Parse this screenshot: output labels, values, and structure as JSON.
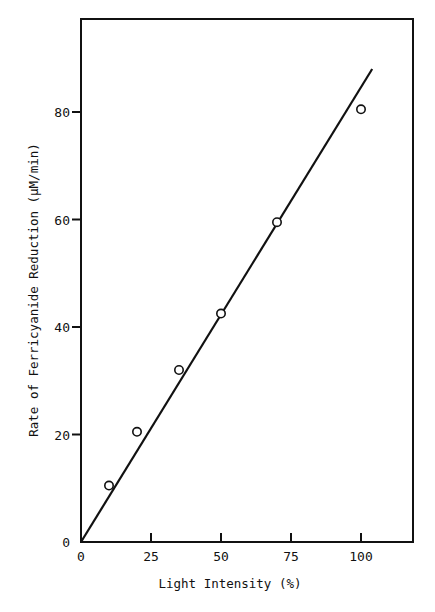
{
  "chart_data": {
    "type": "scatter",
    "title": "",
    "xlabel": "Light Intensity  (%)",
    "ylabel": "Rate of Ferricyanide Reduction  (µM/min)",
    "xlim": [
      0,
      118
    ],
    "ylim": [
      0,
      98
    ],
    "x_ticks": [
      0,
      25,
      50,
      75,
      100
    ],
    "x_tick_labels": [
      "0",
      "25",
      "50",
      "75",
      "100"
    ],
    "y_ticks": [
      0,
      20,
      40,
      60,
      80
    ],
    "y_tick_labels": [
      "0",
      "20",
      "40",
      "60",
      "80"
    ],
    "grid": false,
    "legend": null,
    "series": [
      {
        "name": "measured",
        "marker": "open-circle",
        "x": [
          10,
          20,
          35,
          50,
          70,
          100
        ],
        "y": [
          10.5,
          20.5,
          32,
          42.5,
          59.5,
          80.5
        ]
      },
      {
        "name": "linear fit",
        "style": "line",
        "x": [
          0,
          104
        ],
        "y": [
          0,
          88
        ]
      }
    ]
  },
  "labels": {
    "x_axis": "Light Intensity  (%)",
    "y_axis": "Rate of Ferricyanide Reduction  (µM/min)"
  }
}
